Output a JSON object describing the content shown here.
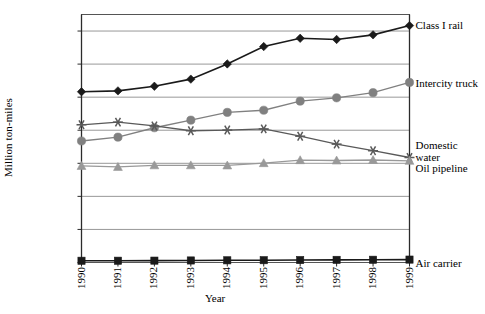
{
  "chart_data": {
    "type": "line",
    "title": "",
    "xlabel": "Year",
    "ylabel": "Million ton-miles",
    "x": [
      1990,
      1991,
      1992,
      1993,
      1994,
      1995,
      1996,
      1997,
      1998,
      1999
    ],
    "categories": [
      "1990",
      "1991",
      "1992",
      "1993",
      "1994",
      "1995",
      "1996",
      "1997",
      "1998",
      "1999"
    ],
    "ylim": [
      0,
      1500000
    ],
    "yticks": [
      0,
      200000,
      400000,
      600000,
      800000,
      1000000,
      1200000,
      1400000
    ],
    "ytick_labels": [
      "0",
      "200,000",
      "400,000",
      "600,000",
      "800,000",
      "1,000,000",
      "1,200,000",
      "1,400,000"
    ],
    "grid": true,
    "grid_axis": "y",
    "legend_position": "right-of-plot-line-end",
    "series": [
      {
        "name": "Class I rail",
        "marker": "diamond",
        "color": "#1a1a1a",
        "values": [
          1033000,
          1038000,
          1066000,
          1109000,
          1201000,
          1306000,
          1356000,
          1349000,
          1377000,
          1433000
        ]
      },
      {
        "name": "Intercity truck",
        "marker": "circle",
        "color": "#808080",
        "values": [
          735000,
          758000,
          815000,
          861000,
          908000,
          921000,
          976000,
          996000,
          1027000,
          1089000
        ]
      },
      {
        "name": "Domestic\nwater",
        "marker": "asterisk",
        "color": "#595959",
        "values": [
          833000,
          849000,
          826000,
          797000,
          801000,
          808000,
          764000,
          716000,
          676000,
          635000
        ]
      },
      {
        "name": "Oil pipeline",
        "marker": "triangle",
        "color": "#999999",
        "values": [
          584000,
          578000,
          588000,
          588000,
          587000,
          601000,
          619000,
          617000,
          620000,
          615000
        ]
      },
      {
        "name": "Air carrier",
        "marker": "square",
        "color": "#1a1a1a",
        "values": [
          10600,
          10800,
          11300,
          12300,
          13200,
          13900,
          14800,
          16000,
          16600,
          17600
        ]
      }
    ]
  },
  "axes": {
    "y_title": "Million ton-miles",
    "x_title": "Year"
  }
}
